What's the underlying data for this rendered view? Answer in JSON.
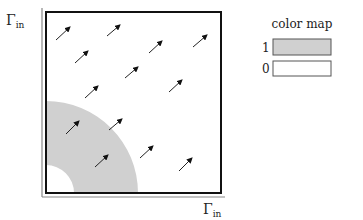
{
  "diagram": {
    "axis_label_y": "Γ",
    "axis_label_y_sub": "in",
    "axis_label_x": "Γ",
    "axis_label_x_sub": "in",
    "domain_box": {
      "x": 46,
      "y": 12,
      "w": 175,
      "h": 181
    },
    "ring": {
      "cx": 46,
      "cy": 193,
      "r_outer": 92,
      "r_inner": 28,
      "color": "#d0d0d0"
    },
    "arrows": [
      {
        "x1": 56,
        "y1": 40,
        "x2": 70,
        "y2": 27
      },
      {
        "x1": 107,
        "y1": 36,
        "x2": 120,
        "y2": 25
      },
      {
        "x1": 75,
        "y1": 63,
        "x2": 88,
        "y2": 51
      },
      {
        "x1": 149,
        "y1": 53,
        "x2": 162,
        "y2": 41
      },
      {
        "x1": 193,
        "y1": 47,
        "x2": 207,
        "y2": 35
      },
      {
        "x1": 85,
        "y1": 98,
        "x2": 98,
        "y2": 86
      },
      {
        "x1": 125,
        "y1": 78,
        "x2": 138,
        "y2": 67
      },
      {
        "x1": 169,
        "y1": 92,
        "x2": 182,
        "y2": 80
      },
      {
        "x1": 66,
        "y1": 134,
        "x2": 79,
        "y2": 121
      },
      {
        "x1": 109,
        "y1": 130,
        "x2": 122,
        "y2": 119
      },
      {
        "x1": 140,
        "y1": 158,
        "x2": 153,
        "y2": 146
      },
      {
        "x1": 95,
        "y1": 167,
        "x2": 108,
        "y2": 155
      },
      {
        "x1": 179,
        "y1": 171,
        "x2": 192,
        "y2": 158
      }
    ]
  },
  "legend": {
    "title": "color map",
    "entries": [
      {
        "label": "1",
        "color": "#d0d0d0"
      },
      {
        "label": "0",
        "color": "#ffffff"
      }
    ]
  }
}
